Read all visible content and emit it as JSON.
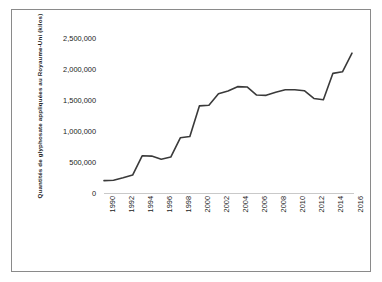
{
  "chart_data": {
    "type": "line",
    "title": "",
    "subtitle": "",
    "xlabel": "",
    "ylabel": "Quantités de glyphosate appliquées au Royaume-Uni (kilos)",
    "x": [
      1990,
      1991,
      1992,
      1993,
      1994,
      1995,
      1996,
      1997,
      1998,
      1999,
      2000,
      2001,
      2002,
      2003,
      2004,
      2005,
      2006,
      2007,
      2008,
      2009,
      2010,
      2011,
      2012,
      2013,
      2014,
      2015,
      2016
    ],
    "values": [
      200000,
      205000,
      245000,
      290000,
      600000,
      595000,
      545000,
      580000,
      890000,
      910000,
      1405000,
      1415000,
      1600000,
      1645000,
      1715000,
      1710000,
      1580000,
      1575000,
      1625000,
      1665000,
      1665000,
      1650000,
      1525000,
      1505000,
      1930000,
      1955000,
      2255000
    ],
    "series": [
      {
        "name": "Quantités de glyphosate appliquées au Royaume-Uni (kilos)",
        "values": [
          200000,
          205000,
          245000,
          290000,
          600000,
          595000,
          545000,
          580000,
          890000,
          910000,
          1405000,
          1415000,
          1600000,
          1645000,
          1715000,
          1710000,
          1580000,
          1575000,
          1625000,
          1665000,
          1665000,
          1650000,
          1525000,
          1505000,
          1930000,
          1955000,
          2255000
        ]
      }
    ],
    "x_tick_labels": [
      "1990",
      "1992",
      "1994",
      "1996",
      "1998",
      "2000",
      "2002",
      "2004",
      "2006",
      "2008",
      "2010",
      "2012",
      "2014",
      "2016"
    ],
    "x_tick_values": [
      1990,
      1992,
      1994,
      1996,
      1998,
      2000,
      2002,
      2004,
      2006,
      2008,
      2010,
      2012,
      2014,
      2016
    ],
    "y_tick_labels": [
      "0",
      "500,000",
      "1,000,000",
      "1,500,000",
      "2,000,000",
      "2,500,000"
    ],
    "y_tick_values": [
      0,
      500000,
      1000000,
      1500000,
      2000000,
      2500000
    ],
    "xlim": [
      1990,
      2016
    ],
    "ylim": [
      0,
      2500000
    ],
    "grid": false,
    "legend": false,
    "legend_position": "none",
    "line_color": "#3a3a3a",
    "axis_color": "#c9c9c9",
    "border_color": "#8a8a8a",
    "background_color": "#ffffff",
    "annotations": []
  }
}
